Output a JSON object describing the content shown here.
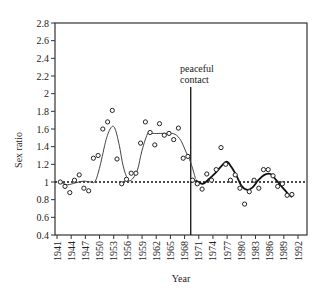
{
  "chart_data": {
    "type": "scatter",
    "title": "",
    "xlabel": "Year",
    "ylabel": "Sex ratio",
    "ylim": [
      0.4,
      2.8
    ],
    "xlim": [
      1941,
      1992
    ],
    "grid": false,
    "legend": null,
    "y_ticks": [
      "2.8",
      "2.6",
      "2.4",
      "2.2",
      "2",
      "1.8",
      "1.6",
      "1.4",
      "1.2",
      "1",
      "0.8",
      "0.6",
      "0.4"
    ],
    "x_ticks": [
      "1941",
      "1944",
      "1947",
      "1950",
      "1953",
      "1956",
      "1959",
      "1962",
      "1965",
      "1968",
      "1971",
      "1974",
      "1977",
      "1980",
      "1983",
      "1986",
      "1989",
      "1992"
    ],
    "reference_line": {
      "y": 1.0,
      "style": "dotted"
    },
    "annotation": {
      "text_line1": "peaceful",
      "text_line2": "contact",
      "x": 1969.3
    },
    "series": [
      {
        "name": "observed",
        "style": "open-circle",
        "x": [
          1941,
          1942,
          1943,
          1944,
          1945,
          1946,
          1947,
          1948,
          1949,
          1950,
          1951,
          1952,
          1953,
          1954,
          1955,
          1956,
          1957,
          1958,
          1959,
          1960,
          1961,
          1962,
          1963,
          1964,
          1965,
          1966,
          1967,
          1968,
          1969,
          1970,
          1971,
          1972,
          1973,
          1974,
          1975,
          1976,
          1977,
          1978,
          1979,
          1980,
          1981,
          1982,
          1983,
          1984,
          1985,
          1986,
          1987,
          1988,
          1989,
          1990
        ],
        "values": [
          1.0,
          0.95,
          0.88,
          1.02,
          1.08,
          0.93,
          0.9,
          1.27,
          1.3,
          1.6,
          1.68,
          1.81,
          1.26,
          0.98,
          1.03,
          1.1,
          1.1,
          1.44,
          1.68,
          1.56,
          1.42,
          1.66,
          1.53,
          1.55,
          1.48,
          1.61,
          1.27,
          1.29,
          1.02,
          0.98,
          0.92,
          1.09,
          1.02,
          1.14,
          1.39,
          1.2,
          1.02,
          1.08,
          0.93,
          0.75,
          0.89,
          1.02,
          0.93,
          1.14,
          1.14,
          1.07,
          0.95,
          0.98,
          0.85,
          0.86
        ]
      },
      {
        "name": "smoothed before contact",
        "style": "thin-line",
        "x": [
          1941,
          1942.5,
          1944.2,
          1945.9,
          1947.5,
          1948.4,
          1949.4,
          1950.7,
          1951.8,
          1952.6,
          1953.5,
          1954.3,
          1955.2,
          1956,
          1957.3,
          1958.3,
          1959.6,
          1960.6,
          1962.3,
          1963.8,
          1965.3,
          1966.5,
          1967.6,
          1968.6,
          1969.6
        ],
        "values": [
          1.0,
          0.97,
          0.99,
          1.01,
          1.0,
          1.01,
          1.18,
          1.48,
          1.62,
          1.6,
          1.41,
          1.18,
          1.04,
          1.02,
          1.13,
          1.36,
          1.56,
          1.55,
          1.55,
          1.55,
          1.54,
          1.47,
          1.34,
          1.22,
          1.04
        ]
      },
      {
        "name": "smoothed after contact",
        "style": "thick-line",
        "x": [
          1969.6,
          1971.1,
          1972.6,
          1973.8,
          1975.1,
          1976.2,
          1977.2,
          1978.3,
          1979.3,
          1980.6,
          1981.7,
          1982.9,
          1984.2,
          1985.5,
          1986.7,
          1988,
          1989.3,
          1990.1
        ],
        "values": [
          1.02,
          0.98,
          1.04,
          1.1,
          1.18,
          1.23,
          1.17,
          1.07,
          0.96,
          0.91,
          0.94,
          1.02,
          1.08,
          1.09,
          1.02,
          0.94,
          0.86,
          0.83
        ]
      }
    ]
  }
}
